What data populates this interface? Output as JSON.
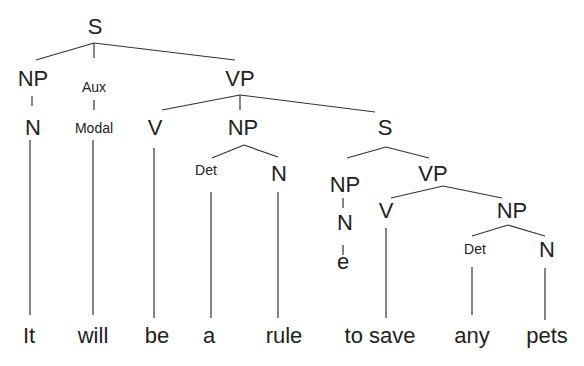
{
  "diagram": {
    "type": "syntax-tree",
    "sentence": "It will be a rule to save any pets",
    "nodes": {
      "s_root": "S",
      "np_subj": "NP",
      "n_subj": "N",
      "aux": "Aux",
      "modal": "Modal",
      "vp_main": "VP",
      "v_main": "V",
      "np_obj": "NP",
      "det_obj": "Det",
      "n_obj": "N",
      "s_emb": "S",
      "np_emb": "NP",
      "n_emb": "N",
      "e_emb": "e",
      "vp_emb": "VP",
      "v_emb": "V",
      "np_emb_obj": "NP",
      "det_emb": "Det",
      "n_emb_obj": "N"
    },
    "words": [
      "It",
      "will",
      "be",
      "a",
      "rule",
      "to save",
      "any",
      "pets"
    ]
  }
}
